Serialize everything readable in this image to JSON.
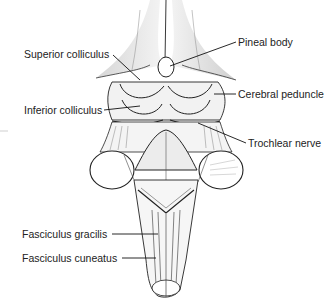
{
  "diagram": {
    "labels": [
      {
        "id": "superior-colliculus",
        "text": "Superior colliculus",
        "side": "left"
      },
      {
        "id": "inferior-colliculus",
        "text": "Inferior colliculus",
        "side": "left"
      },
      {
        "id": "fasciculus-gracilis",
        "text": "Fasciculus gracilis",
        "side": "left"
      },
      {
        "id": "fasciculus-cuneatus",
        "text": "Fasciculus cuneatus",
        "side": "left"
      },
      {
        "id": "pineal-body",
        "text": "Pineal body",
        "side": "right"
      },
      {
        "id": "cerebral-peduncle",
        "text": "Cerebral peduncle",
        "side": "right"
      },
      {
        "id": "trochlear-nerve",
        "text": "Trochlear nerve",
        "side": "right"
      }
    ],
    "colors": {
      "line": "#1a1a1a",
      "text": "#222222",
      "shade": "#d8d8d8",
      "background": "#ffffff"
    }
  }
}
